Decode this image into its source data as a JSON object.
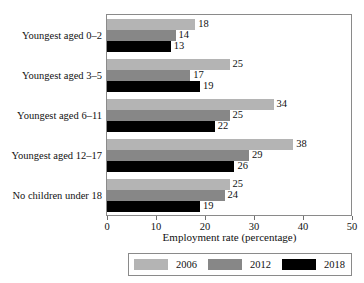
{
  "chart_data": {
    "type": "bar",
    "orientation": "horizontal",
    "title": "",
    "xlabel": "Employment rate (percentage)",
    "ylabel": "",
    "xlim": [
      0,
      50
    ],
    "xticks": [
      0,
      10,
      20,
      30,
      40,
      50
    ],
    "grid": false,
    "legend_position": "bottom",
    "categories": [
      "Youngest aged 0–2",
      "Youngest aged 3–5",
      "Youngest aged 6–11",
      "Youngest aged 12–17",
      "No children under 18"
    ],
    "series": [
      {
        "name": "2006",
        "color": "#b4b4b4",
        "values": [
          18,
          25,
          34,
          38,
          25
        ]
      },
      {
        "name": "2012",
        "color": "#878787",
        "values": [
          14,
          17,
          25,
          29,
          24
        ]
      },
      {
        "name": "2018",
        "color": "#000000",
        "values": [
          13,
          19,
          22,
          26,
          19
        ]
      }
    ]
  },
  "axis": {
    "x_title": "Employment rate (percentage)",
    "tick_labels": [
      "0",
      "10",
      "20",
      "30",
      "40",
      "50"
    ]
  },
  "legend": {
    "items": [
      {
        "label": "2006",
        "color": "#b4b4b4"
      },
      {
        "label": "2012",
        "color": "#878787"
      },
      {
        "label": "2018",
        "color": "#000000"
      }
    ]
  }
}
